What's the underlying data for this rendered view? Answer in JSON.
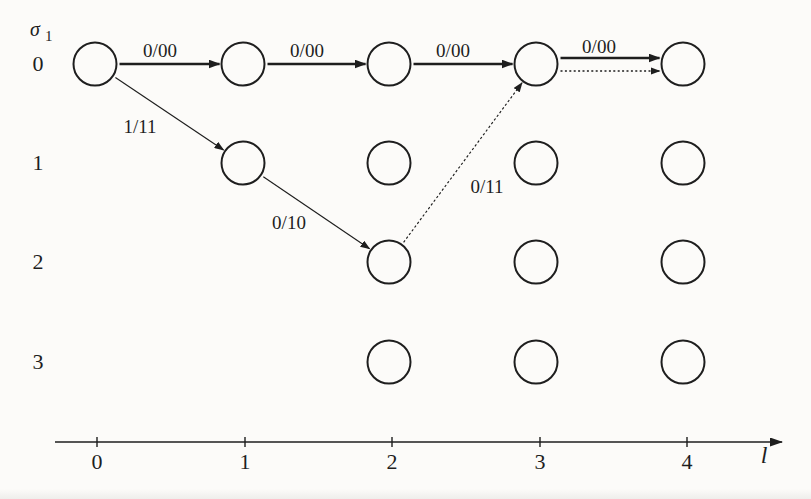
{
  "figure": {
    "ink_color": "#1e1e1e",
    "paper_color": "#fcfbf9",
    "state_axis": {
      "symbol": "σ",
      "symbol_sub": "1",
      "state_labels": [
        "0",
        "1",
        "2",
        "3"
      ],
      "label_x": 38
    },
    "time_axis": {
      "title": "l",
      "y": 442,
      "x_start": 55,
      "x_end": 782,
      "tick_x": [
        97,
        245,
        392,
        540,
        687
      ],
      "tick_labels": [
        "0",
        "1",
        "2",
        "3",
        "4"
      ],
      "tick_label_y": 469,
      "title_x": 764,
      "title_y": 463
    },
    "grid": {
      "col_x": [
        95,
        243,
        389,
        536,
        683
      ],
      "row_y": [
        64,
        163,
        262,
        362
      ],
      "node_radius": 21.5
    },
    "nodes": [
      [
        0,
        0
      ],
      [
        1,
        0
      ],
      [
        2,
        0
      ],
      [
        3,
        0
      ],
      [
        4,
        0
      ],
      [
        1,
        1
      ],
      [
        2,
        1
      ],
      [
        3,
        1
      ],
      [
        4,
        1
      ],
      [
        2,
        2
      ],
      [
        3,
        2
      ],
      [
        4,
        2
      ],
      [
        2,
        3
      ],
      [
        3,
        3
      ],
      [
        4,
        3
      ]
    ],
    "edges": [
      {
        "from": [
          0,
          0
        ],
        "to": [
          1,
          0
        ],
        "style": "solid",
        "label": "0/00",
        "label_pos": [
          160,
          57
        ]
      },
      {
        "from": [
          1,
          0
        ],
        "to": [
          2,
          0
        ],
        "style": "solid",
        "label": "0/00",
        "label_pos": [
          307,
          57
        ]
      },
      {
        "from": [
          2,
          0
        ],
        "to": [
          3,
          0
        ],
        "style": "solid",
        "label": "0/00",
        "label_pos": [
          453,
          57
        ]
      },
      {
        "from": [
          3,
          0
        ],
        "to": [
          4,
          0
        ],
        "style": "solid",
        "label": "0/00",
        "label_pos": [
          599,
          53
        ],
        "offset_y": -6
      },
      {
        "from": [
          3,
          0
        ],
        "to": [
          4,
          0
        ],
        "style": "dotted",
        "label": "",
        "offset_y": 7
      },
      {
        "from": [
          0,
          0
        ],
        "to": [
          1,
          1
        ],
        "style": "thin",
        "label": "1/11",
        "label_pos": [
          140,
          133
        ]
      },
      {
        "from": [
          1,
          1
        ],
        "to": [
          2,
          2
        ],
        "style": "thin",
        "label": "0/10",
        "label_pos": [
          289,
          229
        ]
      },
      {
        "from": [
          2,
          2
        ],
        "to": [
          3,
          0
        ],
        "style": "thin-dotted",
        "label": "0/11",
        "label_pos": [
          487,
          193
        ]
      }
    ]
  }
}
